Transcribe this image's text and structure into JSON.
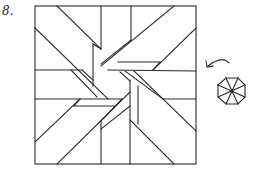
{
  "problem": {
    "number_label": "8."
  },
  "figure": {
    "line_color": "#2a2a2a",
    "background": "#ffffff"
  },
  "hint": {
    "arrow": "counterclockwise-arrow",
    "shape": "octagon-divided-8"
  }
}
